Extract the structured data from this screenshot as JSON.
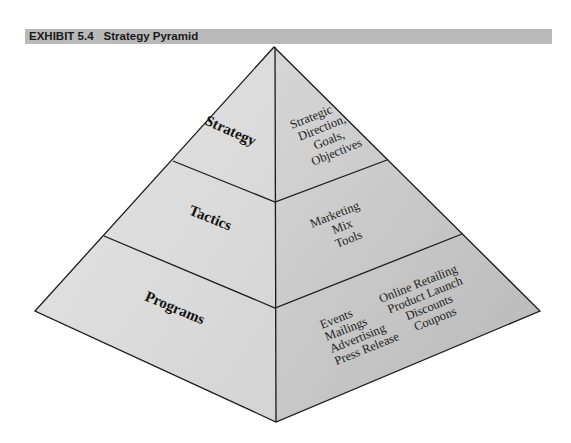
{
  "exhibit": {
    "number": "EXHIBIT 5.4",
    "title": "Strategy Pyramid"
  },
  "pyramid": {
    "tiers": [
      {
        "name": "Strategy",
        "items": [
          "Strategic",
          "Direction,",
          "Goals,",
          "Objectives"
        ]
      },
      {
        "name": "Tactics",
        "items": [
          "Marketing",
          "Mix",
          "Tools"
        ]
      },
      {
        "name": "Programs",
        "items_col1": [
          "Events",
          "Mailings",
          "Advertising",
          "Press Release"
        ],
        "items_col2": [
          "Online Retailing",
          "Product Launch",
          "Discounts",
          "Coupons"
        ]
      }
    ]
  },
  "colors": {
    "header_bg": "#b9b9b9",
    "left_face": "#dcdcdc",
    "right_face": "#c8c8c8",
    "edge": "#1a1a1a"
  }
}
